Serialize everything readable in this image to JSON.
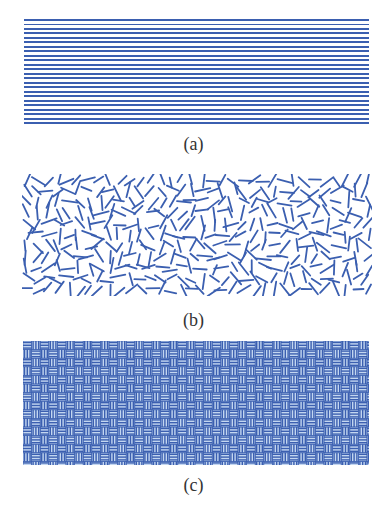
{
  "figure": {
    "panels": [
      {
        "id": "a",
        "label": "(a)",
        "description": "parallel horizontal lines"
      },
      {
        "id": "b",
        "label": "(b)",
        "description": "randomly oriented short line segments"
      },
      {
        "id": "c",
        "label": "(c)",
        "description": "basket-weave pattern"
      }
    ],
    "colors": {
      "line": "#3b5fb0",
      "weave_bg": "#c3d6f0",
      "background": "#ffffff"
    }
  }
}
